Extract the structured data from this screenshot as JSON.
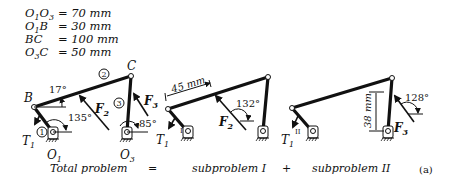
{
  "given": [
    {
      "lhs_main": "O",
      "lhs_sub1": "1",
      "lhs_mid": "O",
      "lhs_sub2": "3",
      "value": "= 70 mm"
    },
    {
      "lhs_main": "O",
      "lhs_sub1": "1",
      "lhs_mid": "B",
      "lhs_sub2": "",
      "value": "= 30 mm"
    },
    {
      "lhs_main": "BC",
      "lhs_sub1": "",
      "lhs_mid": "",
      "lhs_sub2": "",
      "value": "= 100 mm"
    },
    {
      "lhs_main": "O",
      "lhs_sub1": "3",
      "lhs_mid": "C",
      "lhs_sub2": "",
      "value": "= 50 mm"
    }
  ],
  "total": {
    "point_b": "B",
    "point_c": "C",
    "angle_bc": "17°",
    "angle_crank": "135°",
    "angle_f3": "85°",
    "link1": "1",
    "link2": "2",
    "link3": "3",
    "torque": "T",
    "torque_sub": "1",
    "f2": "F",
    "f2_sub": "2",
    "f3": "F",
    "f3_sub": "3",
    "o1": "O",
    "o1_sub": "1",
    "o3": "O",
    "o3_sub": "3"
  },
  "sub1": {
    "dim": "45 mm",
    "angle_f2": "132°",
    "torque": "T",
    "torque_sub": "1",
    "torque_sup": "I",
    "f2": "F",
    "f2_sub": "2"
  },
  "sub2": {
    "dim": "38 mm",
    "angle_f3": "128°",
    "torque": "T",
    "torque_sub": "1",
    "torque_sup": "II",
    "f3": "F",
    "f3_sub": "3"
  },
  "caption": {
    "total": "Total problem",
    "equals": "=",
    "sub1": "subproblem I",
    "plus": "+",
    "sub2": "subproblem II",
    "tag": "(a)"
  }
}
